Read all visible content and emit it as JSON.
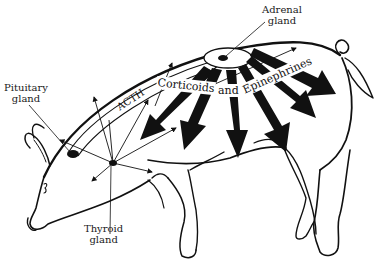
{
  "diagram": {
    "labels": {
      "pituitary": [
        "Pituitary",
        "gland"
      ],
      "adrenal": [
        "Adrenal",
        "gland"
      ],
      "thyroid": [
        "Thyroid",
        "gland"
      ],
      "acth": "ACTH",
      "corticoids": "Corticoids",
      "and": "and",
      "epinephrines": "Epinephrines"
    },
    "colors": {
      "ink": "#111111",
      "background": "#ffffff"
    }
  }
}
